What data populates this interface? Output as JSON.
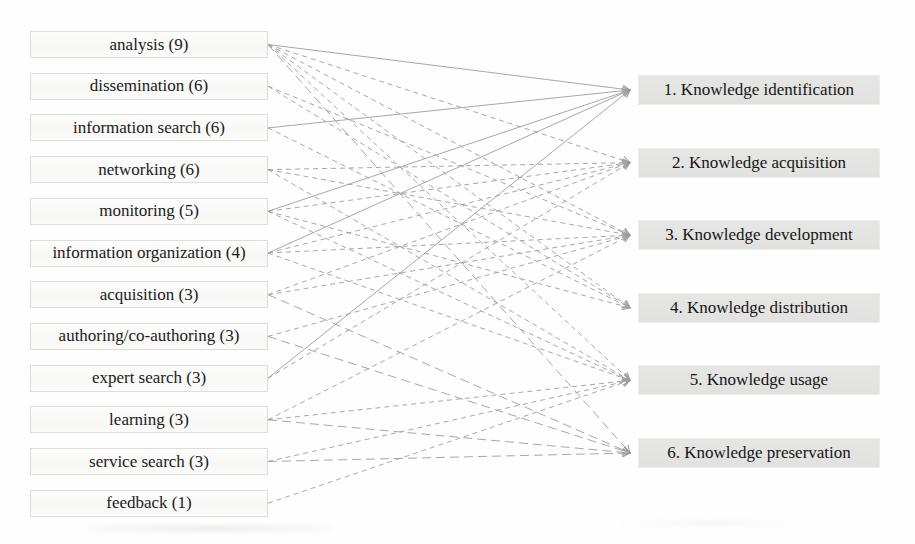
{
  "figure": {
    "colors": {
      "background": "#fefefe",
      "line": "#9d9d9d",
      "left_box_bg": "#fafaf8",
      "left_box_border": "#dcdcda",
      "right_box_bg": "#e3e3e1",
      "text": "#1b1b1b"
    },
    "left_column": {
      "items": [
        {
          "label": "analysis (9)",
          "name": "analysis",
          "count": 9
        },
        {
          "label": "dissemination (6)",
          "name": "dissemination",
          "count": 6
        },
        {
          "label": "information search (6)",
          "name": "information-search",
          "count": 6
        },
        {
          "label": "networking (6)",
          "name": "networking",
          "count": 6
        },
        {
          "label": "monitoring (5)",
          "name": "monitoring",
          "count": 5
        },
        {
          "label": "information organization (4)",
          "name": "information-organization",
          "count": 4
        },
        {
          "label": "acquisition (3)",
          "name": "acquisition",
          "count": 3
        },
        {
          "label": "authoring/co-authoring (3)",
          "name": "authoring-co-authoring",
          "count": 3
        },
        {
          "label": "expert search (3)",
          "name": "expert-search",
          "count": 3
        },
        {
          "label": "learning (3)",
          "name": "learning",
          "count": 3
        },
        {
          "label": "service search (3)",
          "name": "service-search",
          "count": 3
        },
        {
          "label": "feedback (1)",
          "name": "feedback",
          "count": 1
        }
      ]
    },
    "right_column": {
      "items": [
        {
          "label": "1. Knowledge identification",
          "number": 1,
          "name": "knowledge-identification"
        },
        {
          "label": "2. Knowledge acquisition",
          "number": 2,
          "name": "knowledge-acquisition"
        },
        {
          "label": "3. Knowledge development",
          "number": 3,
          "name": "knowledge-development"
        },
        {
          "label": "4. Knowledge distribution",
          "number": 4,
          "name": "knowledge-distribution"
        },
        {
          "label": "5. Knowledge usage",
          "number": 5,
          "name": "knowledge-usage"
        },
        {
          "label": "6. Knowledge preservation",
          "number": 6,
          "name": "knowledge-preservation"
        }
      ]
    },
    "edges": [
      {
        "from": 0,
        "to": 0,
        "style": "solid"
      },
      {
        "from": 0,
        "to": 1,
        "style": "dashed"
      },
      {
        "from": 0,
        "to": 2,
        "style": "dashed"
      },
      {
        "from": 0,
        "to": 3,
        "style": "dashed"
      },
      {
        "from": 0,
        "to": 4,
        "style": "dashed"
      },
      {
        "from": 0,
        "to": 5,
        "style": "longdash"
      },
      {
        "from": 1,
        "to": 2,
        "style": "dashed"
      },
      {
        "from": 1,
        "to": 3,
        "style": "dashed"
      },
      {
        "from": 2,
        "to": 0,
        "style": "solid"
      },
      {
        "from": 2,
        "to": 3,
        "style": "dashed"
      },
      {
        "from": 3,
        "to": 1,
        "style": "dashed"
      },
      {
        "from": 3,
        "to": 2,
        "style": "dashed"
      },
      {
        "from": 3,
        "to": 4,
        "style": "dashed"
      },
      {
        "from": 4,
        "to": 0,
        "style": "solid"
      },
      {
        "from": 4,
        "to": 1,
        "style": "dashed"
      },
      {
        "from": 4,
        "to": 3,
        "style": "dashed"
      },
      {
        "from": 4,
        "to": 4,
        "style": "dashed"
      },
      {
        "from": 5,
        "to": 0,
        "style": "solid"
      },
      {
        "from": 5,
        "to": 1,
        "style": "dashed"
      },
      {
        "from": 5,
        "to": 2,
        "style": "dashed"
      },
      {
        "from": 5,
        "to": 4,
        "style": "dashed"
      },
      {
        "from": 6,
        "to": 1,
        "style": "dashed"
      },
      {
        "from": 6,
        "to": 2,
        "style": "dashed"
      },
      {
        "from": 6,
        "to": 5,
        "style": "longdash"
      },
      {
        "from": 7,
        "to": 2,
        "style": "dashed"
      },
      {
        "from": 7,
        "to": 5,
        "style": "longdash"
      },
      {
        "from": 8,
        "to": 0,
        "style": "solid"
      },
      {
        "from": 8,
        "to": 1,
        "style": "dashed"
      },
      {
        "from": 9,
        "to": 2,
        "style": "dashed"
      },
      {
        "from": 9,
        "to": 4,
        "style": "dashed"
      },
      {
        "from": 9,
        "to": 5,
        "style": "longdash"
      },
      {
        "from": 10,
        "to": 4,
        "style": "dashed"
      },
      {
        "from": 10,
        "to": 5,
        "style": "longdash"
      },
      {
        "from": 11,
        "to": 4,
        "style": "dashed"
      }
    ]
  }
}
